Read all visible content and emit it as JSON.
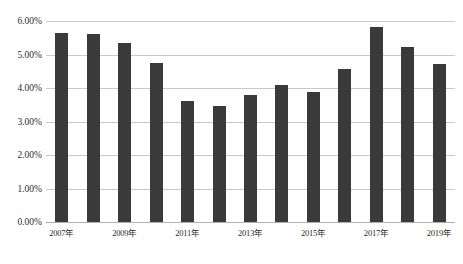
{
  "chart_data": {
    "type": "bar",
    "title": "",
    "xlabel": "",
    "ylabel": "",
    "ylim": [
      0,
      6
    ],
    "grid": true,
    "legend": false,
    "bar_color": "#3a3a3a",
    "gridline_color": "#c9c9c9",
    "categories": [
      "2007年",
      "2008年",
      "2009年",
      "2010年",
      "2011年",
      "2012年",
      "2013年",
      "2014年",
      "2015年",
      "2016年",
      "2017年",
      "2018年",
      "2019年"
    ],
    "values": [
      5.65,
      5.6,
      5.35,
      4.75,
      3.6,
      3.45,
      3.78,
      4.08,
      3.87,
      4.58,
      5.82,
      5.23,
      4.72
    ],
    "value_labels": [
      "5.65%",
      "5.60%",
      "5.35%",
      "4.75%",
      "3.60%",
      "3.45%",
      "3.78%",
      "4.08%",
      "3.87%",
      "4.58%",
      "5.82%",
      "5.23%",
      "4.72%"
    ],
    "ytick_values": [
      0,
      1,
      2,
      3,
      4,
      5,
      6
    ],
    "ytick_labels": [
      "0.00%",
      "1.00%",
      "2.00%",
      "3.00%",
      "4.00%",
      "5.00%",
      "6.00%"
    ],
    "xtick_labels": [
      "2007年",
      "2009年",
      "2011年",
      "2013年",
      "2015年",
      "2017年",
      "2019年"
    ],
    "xtick_category_index": [
      0,
      2,
      4,
      6,
      8,
      10,
      12
    ]
  },
  "caption": {
    "text": ""
  }
}
